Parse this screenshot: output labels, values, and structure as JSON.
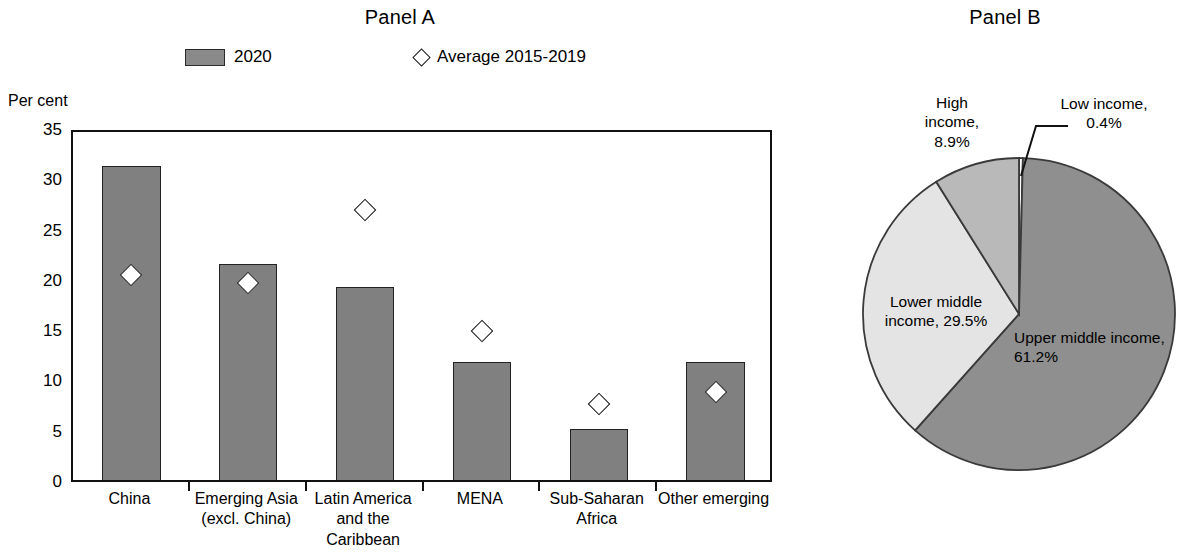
{
  "panel_a": {
    "title": "Panel A",
    "axis_label": "Per cent",
    "legend": [
      {
        "label": "2020",
        "marker": "bar-swatch"
      },
      {
        "label": "Average 2015-2019",
        "marker": "diamond"
      }
    ],
    "y_ticks": [
      "0",
      "5",
      "10",
      "15",
      "20",
      "25",
      "30",
      "35"
    ],
    "categories": [
      "China",
      "Emerging Asia\n(excl. China)",
      "Latin America\nand the\nCaribbean",
      "MENA",
      "Sub-Saharan\nAfrica",
      "Other emerging"
    ]
  },
  "panel_b": {
    "title": "Panel B",
    "labels": [
      {
        "text": "High\nincome,\n8.9%"
      },
      {
        "text": "Low income,\n0.4%"
      },
      {
        "text": "Lower middle\nincome, 29.5%"
      },
      {
        "text": "Upper middle income,\n61.2%"
      }
    ]
  },
  "colors": {
    "bar_fill": "#808080",
    "bar_stroke": "#222222",
    "legend_swatch": "#8a8a8a",
    "axis": "#111111",
    "pie_low_income": "#fbfbfb",
    "pie_upper_middle": "#8f8f8f",
    "pie_lower_middle": "#e4e4e4",
    "pie_high_income": "#b9b9b9",
    "pie_stroke": "#3a3a3a"
  },
  "chart_data": [
    {
      "type": "bar",
      "title": "Panel A",
      "xlabel": "",
      "ylabel": "Per cent",
      "ylim": [
        0,
        35
      ],
      "ytick_step": 5,
      "grid": false,
      "legend_position": "top",
      "categories": [
        "China",
        "Emerging Asia (excl. China)",
        "Latin America and the Caribbean",
        "MENA",
        "Sub-Saharan Africa",
        "Other emerging"
      ],
      "series": [
        {
          "name": "2020",
          "type": "bar",
          "values": [
            31.2,
            21.5,
            19.2,
            11.7,
            5.1,
            11.7
          ]
        },
        {
          "name": "Average 2015-2019",
          "type": "scatter",
          "marker": "diamond",
          "values": [
            20.8,
            20.0,
            27.2,
            15.2,
            8.0,
            9.1
          ]
        }
      ]
    },
    {
      "type": "pie",
      "title": "Panel B",
      "labels": [
        "Low income",
        "Upper middle income",
        "Lower middle income",
        "High income"
      ],
      "values": [
        0.4,
        61.2,
        29.5,
        8.9
      ],
      "units": "per cent",
      "start_angle": 90,
      "direction": "clockwise",
      "legend_position": "none"
    }
  ]
}
